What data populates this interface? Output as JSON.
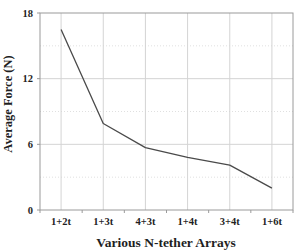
{
  "chart_data": {
    "type": "line",
    "title": "",
    "xlabel": "Various N-tether Arrays",
    "ylabel": "Average Force (N)",
    "categories": [
      "1+2t",
      "1+3t",
      "4+3t",
      "1+4t",
      "3+4t",
      "1+6t"
    ],
    "values": [
      16.5,
      7.9,
      5.7,
      4.8,
      4.1,
      2.0
    ],
    "ylim": [
      0,
      18
    ],
    "yticks": [
      0,
      6,
      12,
      18
    ],
    "y_minor_interval": 3,
    "grid": "on",
    "legend": "none",
    "colors": {
      "line": "#4a4a4a",
      "grid_major": "#d4d4d4",
      "grid_minor": "#e0e0e0",
      "axis_frame": "#9a9a9a",
      "text": "#1f1f1f",
      "background": "#ffffff"
    }
  }
}
